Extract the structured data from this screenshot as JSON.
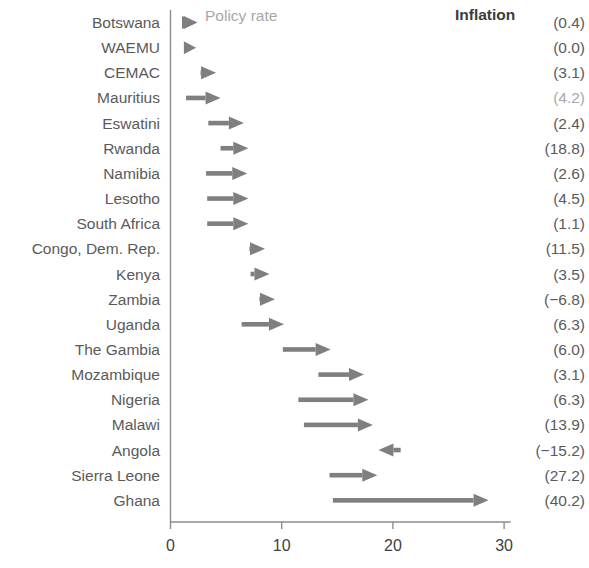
{
  "chart_data": {
    "type": "bar",
    "subtype": "arrow-range (dumbbell with direction)",
    "title": "",
    "xlabel": "",
    "ylabel": "",
    "legend": {
      "label": "Policy rate",
      "position": "top-left-inside"
    },
    "right_column_header": "Inflation",
    "right_column_note": "values shown in parentheses",
    "xlim": [
      0,
      31
    ],
    "xticks": [
      0,
      10,
      20,
      30
    ],
    "xtick_labels": [
      "0",
      "10",
      "20",
      "30"
    ],
    "grid": false,
    "categories": [
      "Botswana",
      "WAEMU",
      "CEMAC",
      "Mauritius",
      "Eswatini",
      "Rwanda",
      "Namibia",
      "Lesotho",
      "South Africa",
      "Congo, Dem. Rep.",
      "Kenya",
      "Zambia",
      "Uganda",
      "The Gambia",
      "Mozambique",
      "Nigeria",
      "Malawi",
      "Angola",
      "Sierra Leone",
      "Ghana"
    ],
    "series": [
      {
        "name": "Policy rate change (start → end)",
        "rows": [
          {
            "category": "Botswana",
            "start": 1.2,
            "end": 2.4,
            "inflation": "(0.4)",
            "inflation_value": 0.4,
            "faint": false
          },
          {
            "category": "WAEMU",
            "start": 1.2,
            "end": 2.3,
            "inflation": "(0.0)",
            "inflation_value": 0.0,
            "faint": false
          },
          {
            "category": "CEMAC",
            "start": 2.7,
            "end": 4.1,
            "inflation": "(3.1)",
            "inflation_value": 3.1,
            "faint": false
          },
          {
            "category": "Mauritius",
            "start": 1.4,
            "end": 4.5,
            "inflation": "(4.2)",
            "inflation_value": 4.2,
            "faint": true
          },
          {
            "category": "Eswatini",
            "start": 3.4,
            "end": 6.6,
            "inflation": "(2.4)",
            "inflation_value": 2.4,
            "faint": false
          },
          {
            "category": "Rwanda",
            "start": 4.5,
            "end": 7.0,
            "inflation": "(18.8)",
            "inflation_value": 18.8,
            "faint": false
          },
          {
            "category": "Namibia",
            "start": 3.2,
            "end": 6.9,
            "inflation": "(2.6)",
            "inflation_value": 2.6,
            "faint": false
          },
          {
            "category": "Lesotho",
            "start": 3.3,
            "end": 7.0,
            "inflation": "(4.5)",
            "inflation_value": 4.5,
            "faint": false
          },
          {
            "category": "South Africa",
            "start": 3.3,
            "end": 7.0,
            "inflation": "(1.1)",
            "inflation_value": 1.1,
            "faint": false
          },
          {
            "category": "Congo, Dem. Rep.",
            "start": 7.1,
            "end": 8.5,
            "inflation": "(11.5)",
            "inflation_value": 11.5,
            "faint": false
          },
          {
            "category": "Kenya",
            "start": 7.2,
            "end": 8.9,
            "inflation": "(3.5)",
            "inflation_value": 3.5,
            "faint": false
          },
          {
            "category": "Zambia",
            "start": 8.0,
            "end": 9.4,
            "inflation": "(−6.8)",
            "inflation_value": -6.8,
            "faint": false
          },
          {
            "category": "Uganda",
            "start": 6.4,
            "end": 10.2,
            "inflation": "(6.3)",
            "inflation_value": 6.3,
            "faint": false
          },
          {
            "category": "The Gambia",
            "start": 10.1,
            "end": 14.4,
            "inflation": "(6.0)",
            "inflation_value": 6.0,
            "faint": false
          },
          {
            "category": "Mozambique",
            "start": 13.3,
            "end": 17.4,
            "inflation": "(3.1)",
            "inflation_value": 3.1,
            "faint": false
          },
          {
            "category": "Nigeria",
            "start": 11.5,
            "end": 17.8,
            "inflation": "(6.3)",
            "inflation_value": 6.3,
            "faint": false
          },
          {
            "category": "Malawi",
            "start": 12.0,
            "end": 18.2,
            "inflation": "(13.9)",
            "inflation_value": 13.9,
            "faint": false
          },
          {
            "category": "Angola",
            "start": 20.7,
            "end": 18.7,
            "inflation": "(−15.2)",
            "inflation_value": -15.2,
            "faint": false
          },
          {
            "category": "Sierra Leone",
            "start": 14.3,
            "end": 18.6,
            "inflation": "(27.2)",
            "inflation_value": 27.2,
            "faint": false
          },
          {
            "category": "Ghana",
            "start": 14.6,
            "end": 28.6,
            "inflation": "(40.2)",
            "inflation_value": 40.2,
            "faint": false
          }
        ]
      }
    ],
    "colors": {
      "arrow": "#7f7f82",
      "axis": "#8d8d8f",
      "label_text": "#5a5a5c",
      "legend_text": "#a8a8aa",
      "header_text": "#3b3b3d"
    }
  }
}
